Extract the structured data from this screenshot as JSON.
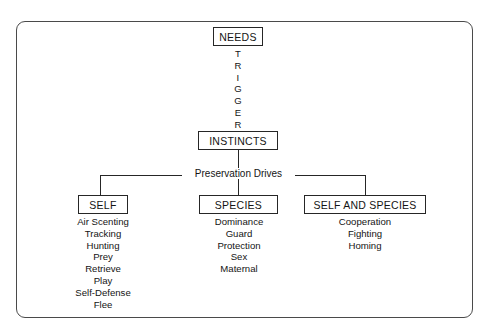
{
  "diagram": {
    "frame_color": "#4a4a4a",
    "line_color": "#262626",
    "text_color": "#141414",
    "background": "#ffffff",
    "root": {
      "label": "NEEDS"
    },
    "connector_word": {
      "text": "TRIGGER",
      "letters": [
        "T",
        "R",
        "I",
        "G",
        "G",
        "E",
        "R"
      ]
    },
    "level2": {
      "label": "INSTINCTS"
    },
    "bus_label": "Preservation Drives",
    "branches": [
      {
        "label": "SELF",
        "items": [
          "Air Scenting",
          "Tracking",
          "Hunting",
          "Prey",
          "Retrieve",
          "Play",
          "Self-Defense",
          "Flee"
        ]
      },
      {
        "label": "SPECIES",
        "items": [
          "Dominance",
          "Guard",
          "Protection",
          "Sex",
          "Maternal"
        ]
      },
      {
        "label": "SELF AND SPECIES",
        "items": [
          "Cooperation",
          "Fighting",
          "Homing"
        ]
      }
    ]
  }
}
